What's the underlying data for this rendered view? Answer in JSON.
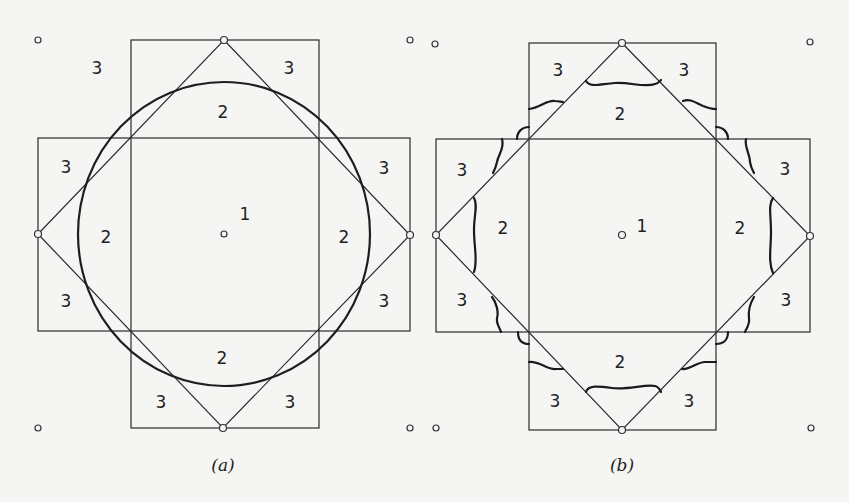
{
  "figure": {
    "panels": [
      {
        "id": "a",
        "caption": "(a)",
        "boundary": "circle",
        "region_labels": {
          "center": "1",
          "top": "2",
          "left": "2",
          "right": "2",
          "bottom": "2",
          "top_left": "3",
          "top_right": "3",
          "left_top": "3",
          "left_bottom": "3",
          "right_top": "3",
          "right_bottom": "3",
          "bottom_left": "3",
          "bottom_right": "3"
        }
      },
      {
        "id": "b",
        "caption": "(b)",
        "boundary": "wavy-curves",
        "region_labels": {
          "center": "1",
          "top": "2",
          "left": "2",
          "right": "2",
          "bottom": "2",
          "top_left": "3",
          "top_right": "3",
          "left_top": "3",
          "left_bottom": "3",
          "right_top": "3",
          "right_bottom": "3",
          "bottom_left": "3",
          "bottom_right": "3"
        }
      }
    ],
    "colors": {
      "background": "#f5f5f3",
      "line": "#2a2a2a"
    }
  }
}
